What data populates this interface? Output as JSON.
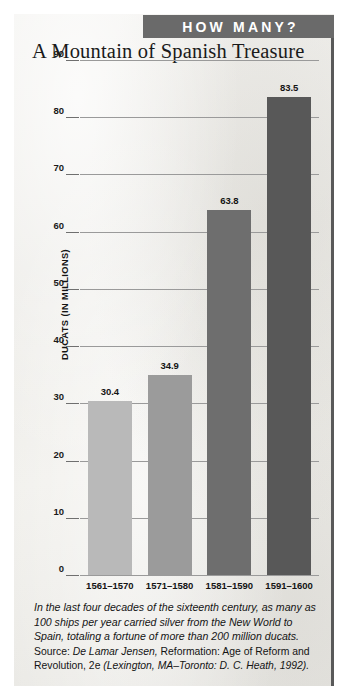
{
  "banner": {
    "label": "HOW MANY?"
  },
  "title": "A Mountain of Spanish Treasure",
  "axis": {
    "ylabel": "DUCATS (IN MILLIONS)"
  },
  "caption": {
    "body": "In the last four decades of the sixteenth century, as many as 100 ships per year carried silver from the New World to Spain, totaling a fortune of more than 200 million ducats.",
    "source_prefix": "Source: ",
    "source_author": "De Lamar Jensen, ",
    "source_title": "Reformation: Age of Reform and Revolution, 2e ",
    "source_pub": "(Lexington, MA–Toronto: D. C. Heath, 1992)."
  },
  "chart_data": {
    "type": "bar",
    "title": "A Mountain of Spanish Treasure",
    "xlabel": "",
    "ylabel": "DUCATS (IN MILLIONS)",
    "categories": [
      "1561–1570",
      "1571–1580",
      "1581–1590",
      "1591–1600"
    ],
    "values": [
      30.4,
      34.9,
      63.8,
      83.5
    ],
    "value_labels": [
      "30.4",
      "34.9",
      "63.8",
      "83.5"
    ],
    "ylim": [
      0,
      90
    ],
    "yticks": [
      0,
      10,
      20,
      30,
      40,
      50,
      60,
      70,
      80,
      90
    ],
    "ytick_labels": [
      "0",
      "10",
      "20",
      "30",
      "40",
      "50",
      "60",
      "70",
      "80",
      "90"
    ],
    "grid": true,
    "legend": "none",
    "bar_colors": [
      "#b9b9b9",
      "#9b9b9b",
      "#6e6e6e",
      "#585858"
    ]
  },
  "colors": {
    "banner_bg": "#6a6a6a",
    "banner_text": "#ffffff",
    "paper": "#efeeea",
    "gridline": "#9a9a9a",
    "edge": "#595959"
  }
}
